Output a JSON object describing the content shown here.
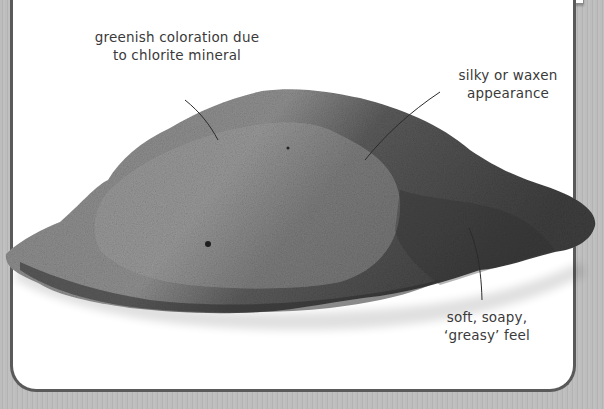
{
  "diagram": {
    "annotations": [
      {
        "id": "color",
        "text_lines": [
          "greenish coloration due",
          "to chlorite mineral"
        ]
      },
      {
        "id": "luster",
        "text_lines": [
          "silky or waxen",
          "appearance"
        ]
      },
      {
        "id": "feel",
        "text_lines": [
          "soft, soapy,",
          "‘greasy’ feel"
        ]
      }
    ],
    "colors": {
      "card_bg": "#ffffff",
      "card_border": "#5a5a5a",
      "page_bg": "#b9b9b9",
      "label_text": "#3a3a3a",
      "rock_light": "#8c8c8c",
      "rock_dark": "#3c3c3c"
    }
  }
}
